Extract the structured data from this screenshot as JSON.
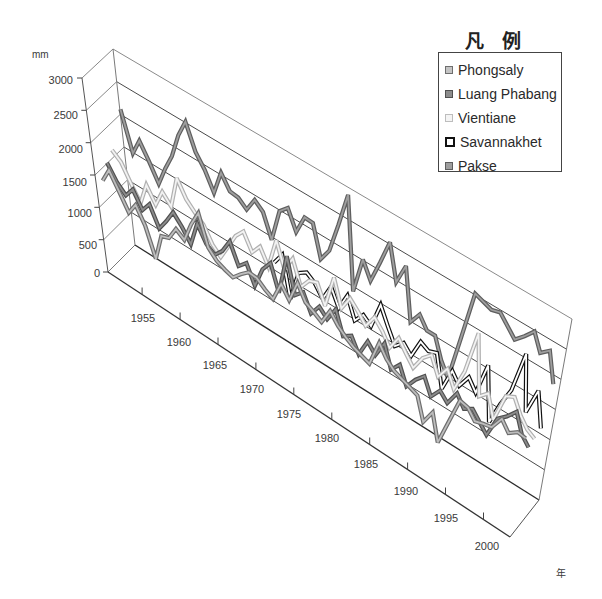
{
  "chart_data": {
    "type": "line",
    "subtype": "3d-line",
    "title": "",
    "xlabel": "年",
    "ylabel": "mm",
    "ylim": [
      0,
      3000
    ],
    "grid": true,
    "legend_position": "top-right",
    "legend_title": "凡例",
    "y_ticks": [
      0,
      500,
      1000,
      1500,
      2000,
      2500,
      3000
    ],
    "y_tick_labels": [
      "0",
      "500",
      "1000",
      "1500",
      "2000",
      "2500",
      "3000"
    ],
    "x_tick_labels": [
      "1955",
      "1960",
      "1965",
      "1970",
      "1975",
      "1980",
      "1985",
      "1990",
      "1995",
      "2000"
    ],
    "x": [
      1951,
      1952,
      1953,
      1954,
      1955,
      1956,
      1957,
      1958,
      1959,
      1960,
      1961,
      1962,
      1963,
      1964,
      1965,
      1966,
      1967,
      1968,
      1969,
      1970,
      1971,
      1972,
      1973,
      1974,
      1975,
      1976,
      1977,
      1978,
      1979,
      1980,
      1981,
      1982,
      1983,
      1984,
      1985,
      1986,
      1987,
      1988,
      1989,
      1990,
      1991,
      1992,
      1993,
      1994,
      1995,
      1996,
      1997,
      1998,
      1999,
      2000,
      2001,
      2002,
      2003
    ],
    "series": [
      {
        "name": "Phongsaly",
        "color": "#bdbdbd",
        "outline": "#6e6e6e",
        "values": [
          1410,
          1650,
          1400,
          1150,
          1350,
          1100,
          670,
          1100,
          1150,
          1370,
          1280,
          1600,
          1860,
          1400,
          1270,
          1210,
          1170,
          1300,
          1410,
          1400,
          1300,
          1230,
          1550,
          1370,
          1730,
          1500,
          1430,
          1350,
          1610,
          1450,
          1350,
          1270,
          1220,
          1170,
          1590,
          1410,
          1300,
          1250,
          1200,
          1150,
          800,
          1040,
          630,
          1050,
          1480,
          1450,
          1310,
          1350,
          1380,
          1600,
          1450,
          1550,
          1530
        ]
      },
      {
        "name": "Luang Phabang",
        "color": "#8c8c8c",
        "outline": "#505050",
        "values": [
          1600,
          1380,
          1250,
          1420,
          1180,
          1350,
          1050,
          1240,
          1460,
          1310,
          1120,
          1520,
          1280,
          1190,
          1330,
          1560,
          1250,
          1380,
          1100,
          1440,
          1620,
          1230,
          1890,
          1350,
          1480,
          1220,
          1410,
          1290,
          1530,
          1180,
          1270,
          1050,
          1340,
          1200,
          1470,
          1130,
          1290,
          1020,
          1210,
          1350,
          1100,
          1280,
          1160,
          1400,
          1230,
          1310,
          1180,
          1050,
          1400,
          1520,
          1680,
          1390,
          1260
        ]
      },
      {
        "name": "Vientiane",
        "color": "#f2f2f2",
        "outline": "#b0b0b0",
        "values": [
          1710,
          1600,
          1350,
          1120,
          1480,
          1250,
          1530,
          1380,
          1900,
          1650,
          1520,
          1410,
          1180,
          1060,
          1300,
          1550,
          1700,
          1450,
          1620,
          1380,
          1880,
          1500,
          1750,
          1380,
          1560,
          1610,
          1320,
          1850,
          1440,
          1680,
          1550,
          1400,
          1620,
          1480,
          1290,
          1530,
          1360,
          1210,
          1450,
          1580,
          1310,
          1520,
          1270,
          1640,
          2350,
          1400,
          1530,
          1180,
          1650,
          1720,
          1500,
          1350,
          1280
        ]
      },
      {
        "name": "Savannakhet",
        "color": "#ffffff",
        "outline": "#111111",
        "values": [
          null,
          null,
          null,
          null,
          null,
          null,
          null,
          null,
          null,
          null,
          null,
          null,
          null,
          null,
          null,
          null,
          null,
          null,
          null,
          1350,
          1550,
          930,
          1420,
          1510,
          1420,
          1250,
          1520,
          1260,
          1540,
          1220,
          1390,
          1290,
          1710,
          1450,
          1210,
          1340,
          1210,
          1520,
          1450,
          1500,
          1000,
          1370,
          1210,
          1430,
          1260,
          1790,
          940,
          1320,
          1630,
          2310,
          1430,
          1870,
          1330
        ]
      },
      {
        "name": "Pakse",
        "color": "#9e9e9e",
        "outline": "#5e5e5e",
        "values": [
          2160,
          1560,
          1830,
          1590,
          1320,
          1630,
          1900,
          2300,
          2590,
          2200,
          2000,
          1720,
          2110,
          1900,
          1880,
          1770,
          2000,
          1890,
          1530,
          2060,
          2190,
          1890,
          2200,
          2190,
          1700,
          1910,
          2400,
          2960,
          1500,
          2090,
          1830,
          2200,
          2610,
          2050,
          2390,
          1570,
          1770,
          1590,
          1590,
          1270,
          1060,
          1800,
          2600,
          2550,
          2500,
          2540,
          2400,
          2260,
          2400,
          2560,
          2290,
          2410,
          1940
        ]
      }
    ]
  }
}
